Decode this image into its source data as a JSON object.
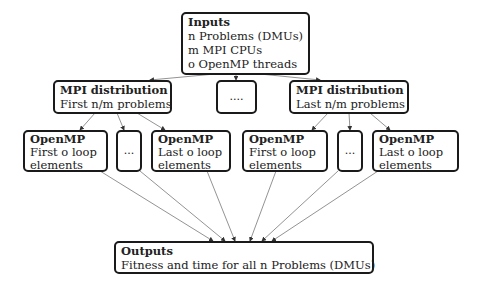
{
  "inputs": {
    "title": "Inputs",
    "lines": [
      "n Problems (DMUs)",
      "m MPI CPUs",
      "o OpenMP threads"
    ]
  },
  "mpi_left": {
    "title": "MPI distribution",
    "line": "First n/m problems"
  },
  "mpi_middle": {
    "label": "...."
  },
  "mpi_right": {
    "title": "MPI distribution",
    "line": "Last n/m problems"
  },
  "openmp": [
    {
      "title": "OpenMP",
      "line1": "First o loop",
      "line2": "elements"
    },
    {
      "label": "..."
    },
    {
      "title": "OpenMP",
      "line1": "Last o loop",
      "line2": "elements"
    },
    {
      "title": "OpenMP",
      "line1": "First o loop",
      "line2": "elements"
    },
    {
      "label": "..."
    },
    {
      "title": "OpenMP",
      "line1": "Last o loop",
      "line2": "elements"
    }
  ],
  "outputs": {
    "title": "Outputs",
    "line": "Fitness and time for all n Problems (DMUs)"
  },
  "colors": {
    "border": "#1a1a1a",
    "edge": "#777777"
  }
}
